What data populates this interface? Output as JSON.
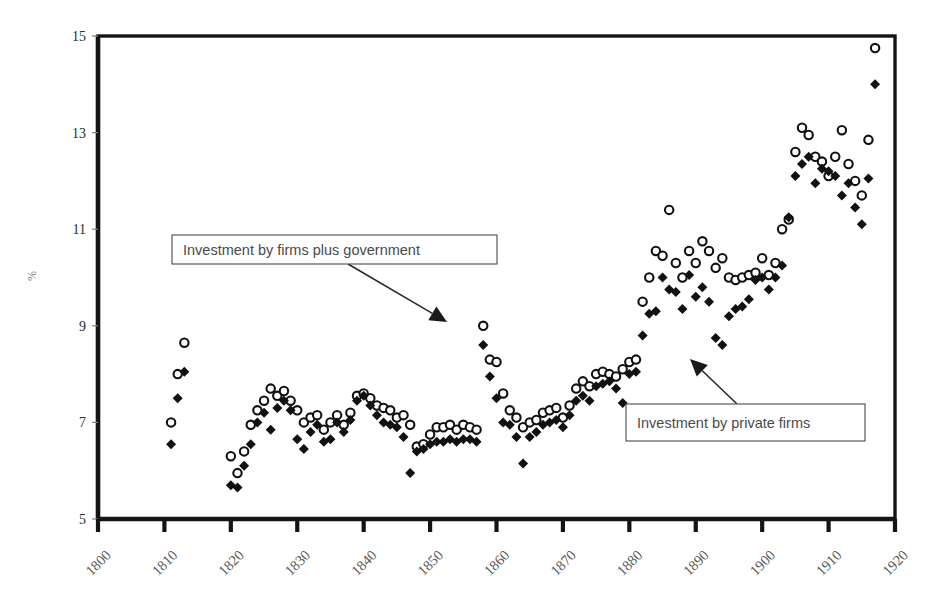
{
  "figure": {
    "clipped_caption_top": "",
    "axis_label_y": "%",
    "annotations": [
      {
        "id": "annot-firms-plus-government",
        "text": "Investment by firms plus government",
        "box": {
          "x": 172,
          "y": 235,
          "w": 325,
          "h": 29
        },
        "arrow_from": {
          "x": 348,
          "y": 264
        },
        "arrow_to": {
          "x": 447,
          "y": 322
        }
      },
      {
        "id": "annot-private-firms",
        "text": "Investment by private firms",
        "box": {
          "x": 626,
          "y": 404,
          "w": 239,
          "h": 37
        },
        "arrow_from": {
          "x": 737,
          "y": 404
        },
        "arrow_to": {
          "x": 690,
          "y": 359
        }
      }
    ]
  },
  "chart_data": {
    "type": "scatter",
    "title": "",
    "xlabel": "",
    "ylabel": "%",
    "xlim": [
      1800,
      1920
    ],
    "ylim": [
      5,
      15
    ],
    "xticks": [
      1800,
      1810,
      1820,
      1830,
      1840,
      1850,
      1860,
      1870,
      1880,
      1890,
      1900,
      1910,
      1920
    ],
    "xticklabels": [
      "1800",
      "1810",
      "1820",
      "1830",
      "1840",
      "1850",
      "1860",
      "1870",
      "1880",
      "1890",
      "1900",
      "1910",
      "1920"
    ],
    "xtick_rotation": 45,
    "yticks": [
      5,
      7,
      9,
      11,
      13,
      15
    ],
    "yticklabels": [
      "5",
      "7",
      "9",
      "11",
      "13",
      "15"
    ],
    "grid": false,
    "legend_position": "annotations",
    "series": [
      {
        "name": "Investment by firms plus government",
        "marker": "open-circle",
        "color": "#111111",
        "points": [
          [
            1811,
            7.0
          ],
          [
            1812,
            8.0
          ],
          [
            1813,
            8.65
          ],
          [
            1820,
            6.3
          ],
          [
            1821,
            5.95
          ],
          [
            1822,
            6.4
          ],
          [
            1823,
            6.95
          ],
          [
            1824,
            7.25
          ],
          [
            1825,
            7.45
          ],
          [
            1826,
            7.7
          ],
          [
            1827,
            7.55
          ],
          [
            1828,
            7.65
          ],
          [
            1829,
            7.45
          ],
          [
            1830,
            7.25
          ],
          [
            1831,
            7.0
          ],
          [
            1832,
            7.1
          ],
          [
            1833,
            7.15
          ],
          [
            1834,
            6.85
          ],
          [
            1835,
            7.0
          ],
          [
            1836,
            7.15
          ],
          [
            1837,
            6.95
          ],
          [
            1838,
            7.2
          ],
          [
            1839,
            7.55
          ],
          [
            1840,
            7.6
          ],
          [
            1841,
            7.5
          ],
          [
            1842,
            7.35
          ],
          [
            1843,
            7.3
          ],
          [
            1844,
            7.25
          ],
          [
            1845,
            7.1
          ],
          [
            1846,
            7.15
          ],
          [
            1847,
            6.95
          ],
          [
            1848,
            6.5
          ],
          [
            1849,
            6.55
          ],
          [
            1850,
            6.75
          ],
          [
            1851,
            6.9
          ],
          [
            1852,
            6.9
          ],
          [
            1853,
            6.95
          ],
          [
            1854,
            6.85
          ],
          [
            1855,
            6.95
          ],
          [
            1856,
            6.9
          ],
          [
            1857,
            6.85
          ],
          [
            1858,
            9.0
          ],
          [
            1859,
            8.3
          ],
          [
            1860,
            8.25
          ],
          [
            1861,
            7.6
          ],
          [
            1862,
            7.25
          ],
          [
            1863,
            7.1
          ],
          [
            1864,
            6.9
          ],
          [
            1865,
            7.0
          ],
          [
            1866,
            7.05
          ],
          [
            1867,
            7.2
          ],
          [
            1868,
            7.25
          ],
          [
            1869,
            7.3
          ],
          [
            1870,
            7.1
          ],
          [
            1871,
            7.35
          ],
          [
            1872,
            7.7
          ],
          [
            1873,
            7.85
          ],
          [
            1874,
            7.75
          ],
          [
            1875,
            8.0
          ],
          [
            1876,
            8.05
          ],
          [
            1877,
            8.0
          ],
          [
            1878,
            7.95
          ],
          [
            1879,
            8.1
          ],
          [
            1880,
            8.25
          ],
          [
            1881,
            8.3
          ],
          [
            1882,
            9.5
          ],
          [
            1883,
            10.0
          ],
          [
            1884,
            10.55
          ],
          [
            1885,
            10.45
          ],
          [
            1886,
            11.4
          ],
          [
            1887,
            10.3
          ],
          [
            1888,
            10.0
          ],
          [
            1889,
            10.55
          ],
          [
            1890,
            10.3
          ],
          [
            1891,
            10.75
          ],
          [
            1892,
            10.55
          ],
          [
            1893,
            10.2
          ],
          [
            1894,
            10.4
          ],
          [
            1895,
            10.0
          ],
          [
            1896,
            9.95
          ],
          [
            1897,
            10.0
          ],
          [
            1898,
            10.05
          ],
          [
            1899,
            10.1
          ],
          [
            1900,
            10.4
          ],
          [
            1901,
            10.05
          ],
          [
            1902,
            10.3
          ],
          [
            1903,
            11.0
          ],
          [
            1904,
            11.2
          ],
          [
            1905,
            12.6
          ],
          [
            1906,
            13.1
          ],
          [
            1907,
            12.95
          ],
          [
            1908,
            12.5
          ],
          [
            1909,
            12.4
          ],
          [
            1910,
            12.1
          ],
          [
            1911,
            12.5
          ],
          [
            1912,
            13.05
          ],
          [
            1913,
            12.35
          ],
          [
            1914,
            12.0
          ],
          [
            1915,
            11.7
          ],
          [
            1916,
            12.85
          ],
          [
            1917,
            14.75
          ]
        ]
      },
      {
        "name": "Investment by private firms",
        "marker": "solid-diamond",
        "color": "#111111",
        "points": [
          [
            1811,
            6.55
          ],
          [
            1812,
            7.5
          ],
          [
            1813,
            8.05
          ],
          [
            1820,
            5.7
          ],
          [
            1821,
            5.65
          ],
          [
            1822,
            6.1
          ],
          [
            1823,
            6.55
          ],
          [
            1824,
            7.0
          ],
          [
            1825,
            7.2
          ],
          [
            1826,
            6.85
          ],
          [
            1827,
            7.3
          ],
          [
            1828,
            7.45
          ],
          [
            1829,
            7.25
          ],
          [
            1830,
            6.65
          ],
          [
            1831,
            6.45
          ],
          [
            1832,
            6.8
          ],
          [
            1833,
            6.95
          ],
          [
            1834,
            6.6
          ],
          [
            1835,
            6.65
          ],
          [
            1836,
            7.0
          ],
          [
            1837,
            6.8
          ],
          [
            1838,
            7.05
          ],
          [
            1839,
            7.45
          ],
          [
            1840,
            7.55
          ],
          [
            1841,
            7.35
          ],
          [
            1842,
            7.15
          ],
          [
            1843,
            7.0
          ],
          [
            1844,
            6.95
          ],
          [
            1845,
            6.9
          ],
          [
            1846,
            6.7
          ],
          [
            1847,
            5.95
          ],
          [
            1848,
            6.4
          ],
          [
            1849,
            6.45
          ],
          [
            1850,
            6.55
          ],
          [
            1851,
            6.6
          ],
          [
            1852,
            6.6
          ],
          [
            1853,
            6.65
          ],
          [
            1854,
            6.6
          ],
          [
            1855,
            6.65
          ],
          [
            1856,
            6.65
          ],
          [
            1857,
            6.6
          ],
          [
            1858,
            8.6
          ],
          [
            1859,
            7.95
          ],
          [
            1860,
            7.5
          ],
          [
            1861,
            7.0
          ],
          [
            1862,
            6.95
          ],
          [
            1863,
            6.7
          ],
          [
            1864,
            6.15
          ],
          [
            1865,
            6.7
          ],
          [
            1866,
            6.8
          ],
          [
            1867,
            6.95
          ],
          [
            1868,
            7.0
          ],
          [
            1869,
            7.05
          ],
          [
            1870,
            6.9
          ],
          [
            1871,
            7.15
          ],
          [
            1872,
            7.45
          ],
          [
            1873,
            7.55
          ],
          [
            1874,
            7.45
          ],
          [
            1875,
            7.75
          ],
          [
            1876,
            7.8
          ],
          [
            1877,
            7.85
          ],
          [
            1878,
            7.7
          ],
          [
            1879,
            7.4
          ],
          [
            1880,
            8.0
          ],
          [
            1881,
            8.05
          ],
          [
            1882,
            8.8
          ],
          [
            1883,
            9.25
          ],
          [
            1884,
            9.3
          ],
          [
            1885,
            10.0
          ],
          [
            1886,
            9.75
          ],
          [
            1887,
            9.7
          ],
          [
            1888,
            9.35
          ],
          [
            1889,
            10.05
          ],
          [
            1890,
            9.6
          ],
          [
            1891,
            9.8
          ],
          [
            1892,
            9.5
          ],
          [
            1893,
            8.75
          ],
          [
            1894,
            8.6
          ],
          [
            1895,
            9.2
          ],
          [
            1896,
            9.35
          ],
          [
            1897,
            9.4
          ],
          [
            1898,
            9.55
          ],
          [
            1899,
            9.95
          ],
          [
            1900,
            10.0
          ],
          [
            1901,
            9.75
          ],
          [
            1902,
            10.0
          ],
          [
            1903,
            10.25
          ],
          [
            1904,
            11.25
          ],
          [
            1905,
            12.1
          ],
          [
            1906,
            12.35
          ],
          [
            1907,
            12.5
          ],
          [
            1908,
            11.95
          ],
          [
            1909,
            12.25
          ],
          [
            1910,
            12.2
          ],
          [
            1911,
            12.1
          ],
          [
            1912,
            11.7
          ],
          [
            1913,
            11.95
          ],
          [
            1914,
            11.45
          ],
          [
            1915,
            11.1
          ],
          [
            1916,
            12.05
          ],
          [
            1917,
            14.0
          ]
        ]
      }
    ]
  }
}
